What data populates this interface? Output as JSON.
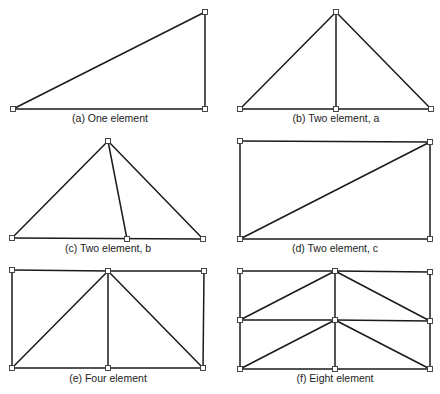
{
  "figure": {
    "panels": [
      {
        "id": "a",
        "caption": "(a) One element",
        "caption_pos": [
          110,
          122
        ],
        "nodes": [
          [
            13,
            109
          ],
          [
            205,
            12
          ],
          [
            205,
            109
          ]
        ],
        "edges": [
          [
            0,
            1
          ],
          [
            1,
            2
          ],
          [
            0,
            2
          ]
        ]
      },
      {
        "id": "b",
        "caption": "(b) Two element, a",
        "caption_pos": [
          336,
          122
        ],
        "nodes": [
          [
            240,
            109
          ],
          [
            336,
            12
          ],
          [
            336,
            109
          ],
          [
            431,
            109
          ]
        ],
        "edges": [
          [
            0,
            1
          ],
          [
            1,
            3
          ],
          [
            0,
            3
          ],
          [
            1,
            2
          ]
        ]
      },
      {
        "id": "c",
        "caption": "(c) Two element, b",
        "caption_pos": [
          108,
          252
        ],
        "nodes": [
          [
            12,
            238
          ],
          [
            108,
            141
          ],
          [
            127,
            239
          ],
          [
            203,
            239
          ]
        ],
        "edges": [
          [
            0,
            1
          ],
          [
            1,
            3
          ],
          [
            0,
            3
          ],
          [
            1,
            2
          ]
        ]
      },
      {
        "id": "d",
        "caption": "(d) Two element, c",
        "caption_pos": [
          335,
          252
        ],
        "nodes": [
          [
            240,
            141
          ],
          [
            430,
            142
          ],
          [
            240,
            239
          ],
          [
            430,
            239
          ]
        ],
        "edges": [
          [
            0,
            1
          ],
          [
            1,
            3
          ],
          [
            2,
            3
          ],
          [
            0,
            2
          ],
          [
            2,
            1
          ]
        ]
      },
      {
        "id": "e",
        "caption": "(e) Four element",
        "caption_pos": [
          108,
          382
        ],
        "nodes": [
          [
            12,
            270
          ],
          [
            108,
            271
          ],
          [
            204,
            271
          ],
          [
            12,
            368
          ],
          [
            108,
            368
          ],
          [
            203,
            368
          ]
        ],
        "edges": [
          [
            0,
            1
          ],
          [
            1,
            2
          ],
          [
            3,
            4
          ],
          [
            4,
            5
          ],
          [
            0,
            3
          ],
          [
            1,
            4
          ],
          [
            2,
            5
          ],
          [
            3,
            1
          ],
          [
            1,
            5
          ]
        ]
      },
      {
        "id": "f",
        "caption": "(f) Eight element",
        "caption_pos": [
          335,
          382
        ],
        "nodes": [
          [
            240,
            271
          ],
          [
            335,
            271
          ],
          [
            430,
            272
          ],
          [
            240,
            320
          ],
          [
            335,
            320
          ],
          [
            430,
            321
          ],
          [
            240,
            369
          ],
          [
            335,
            369
          ],
          [
            430,
            369
          ]
        ],
        "edges": [
          [
            0,
            1
          ],
          [
            1,
            2
          ],
          [
            3,
            4
          ],
          [
            4,
            5
          ],
          [
            6,
            7
          ],
          [
            7,
            8
          ],
          [
            0,
            3
          ],
          [
            3,
            6
          ],
          [
            1,
            4
          ],
          [
            4,
            7
          ],
          [
            2,
            5
          ],
          [
            5,
            8
          ],
          [
            3,
            1
          ],
          [
            1,
            5
          ],
          [
            6,
            4
          ],
          [
            4,
            8
          ]
        ]
      }
    ]
  }
}
